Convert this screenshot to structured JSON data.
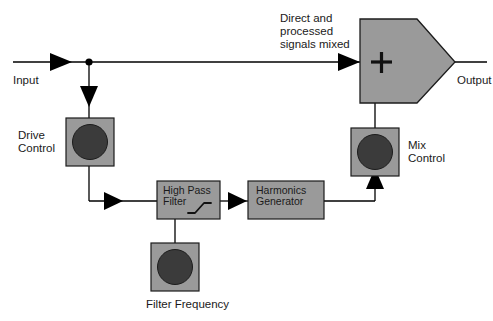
{
  "diagram": {
    "title_text": "",
    "colors": {
      "block_fill": "#9a9a9a",
      "knob_dial": "#3b3b3b",
      "outline": "#1c1c1c",
      "wire": "#000000",
      "background": "#ffffff",
      "text": "#1a1a1a"
    },
    "labels": {
      "input": "Input",
      "output": "Output",
      "direct_mixed_line1": "Direct and",
      "direct_mixed_line2": "processed",
      "direct_mixed_line3": "signals mixed",
      "drive_control_line1": "Drive",
      "drive_control_line2": "Control",
      "mix_control_line1": "Mix",
      "mix_control_line2": "Control",
      "filter_frequency": "Filter Frequency"
    },
    "blocks": [
      {
        "id": "high-pass-filter",
        "line1": "High Pass",
        "line2": "Filter",
        "icon": "highpass-curve-icon"
      },
      {
        "id": "harmonics-generator",
        "line1": "Harmonics",
        "line2": "Generator",
        "icon": ""
      }
    ],
    "knobs": [
      {
        "id": "drive-control",
        "label": "Drive Control"
      },
      {
        "id": "filter-frequency",
        "label": "Filter Frequency"
      },
      {
        "id": "mix-control",
        "label": "Mix Control"
      }
    ],
    "mixer": {
      "id": "summing-mixer",
      "symbol": "+"
    },
    "signal_flow": [
      "Input",
      "Drive Control",
      "High Pass Filter",
      "Harmonics Generator",
      "Mix Control",
      "Summing Mixer",
      "Output"
    ]
  }
}
